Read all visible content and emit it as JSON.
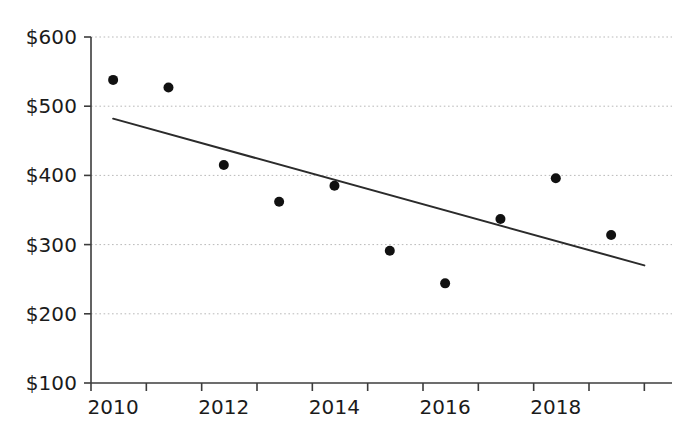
{
  "chart_data": {
    "type": "scatter",
    "title": "",
    "xlabel": "",
    "ylabel": "",
    "x": [
      2010,
      2011,
      2012,
      2013,
      2014,
      2015,
      2016,
      2017,
      2018,
      2019
    ],
    "values": [
      538,
      527,
      415,
      362,
      385,
      291,
      244,
      337,
      396,
      314
    ],
    "series": [
      {
        "name": "data-points",
        "values": [
          538,
          527,
          415,
          362,
          385,
          291,
          244,
          337,
          396,
          314
        ]
      },
      {
        "name": "trendline",
        "type": "line",
        "x": [
          2010,
          2019.6
        ],
        "values": [
          482,
          270
        ]
      }
    ],
    "xlim": [
      2009.6,
      2020.1
    ],
    "ylim": [
      100,
      600
    ],
    "y_ticks": [
      100,
      200,
      300,
      400,
      500,
      600
    ],
    "y_tick_labels": [
      "$100",
      "$200",
      "$300",
      "$400",
      "$500",
      "$600"
    ],
    "x_ticks": [
      2009.6,
      2010.6,
      2011.6,
      2012.6,
      2013.6,
      2014.6,
      2015.6,
      2016.6,
      2017.6,
      2018.6,
      2019.6
    ],
    "x_tick_labels_shown": [
      "2010",
      "2012",
      "2014",
      "2016",
      "2018"
    ],
    "x_tick_label_values": [
      2010,
      2012,
      2014,
      2016,
      2018
    ],
    "grid": true,
    "grid_axis": "y",
    "legend": "none",
    "colors": {
      "point": "#111111",
      "trendline": "#2b2b2b",
      "axis": "#3c3c3c",
      "grid": "#b9b9b9",
      "text": "#1b1b1b",
      "background": "#ffffff"
    },
    "point_radius": 5,
    "trendline_width": 2
  }
}
